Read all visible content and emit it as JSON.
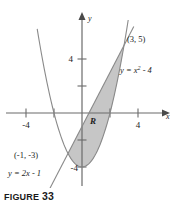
{
  "figure": {
    "caption_word": "FIGURE",
    "caption_number": "33"
  },
  "axes": {
    "x_name": "x",
    "y_name": "y",
    "x_tick_labels": [
      "-4",
      "4"
    ],
    "y_tick_labels": [
      "4",
      "-4"
    ],
    "x_neg4": "-4",
    "x_pos4": "4",
    "y_pos4": "4",
    "y_neg4": "-4"
  },
  "annotations": {
    "region_label": "R",
    "point_upper": "(3, 5)",
    "point_lower": "(-1, -3)",
    "curve_parabola": "y = x",
    "curve_parabola_exp": "2",
    "curve_parabola_tail": " - 4",
    "curve_line": "y = 2x - 1"
  },
  "colors": {
    "shade": "#c6c6c6",
    "axis": "#6b6b6b",
    "curve": "#8a8a8a",
    "text": "#1d1d1d"
  },
  "chart_data": {
    "type": "line",
    "title": "FIGURE 33",
    "xlabel": "x",
    "ylabel": "y",
    "xlim": [
      -5.2,
      6.0
    ],
    "ylim": [
      -5.0,
      6.5
    ],
    "grid": false,
    "legend": "none",
    "series": [
      {
        "name": "y = x^2 - 4",
        "type": "parabola",
        "equation": "y = x^2 - 4",
        "vertex": [
          0,
          -4
        ],
        "x_intercepts": [
          -2,
          2
        ],
        "y_intercept": -4
      },
      {
        "name": "y = 2x - 1",
        "type": "line",
        "equation": "y = 2x - 1",
        "slope": 2,
        "intercept": -1,
        "x_intercept": 0.5
      }
    ],
    "intersections": [
      {
        "label": "(-1, -3)",
        "x": -1,
        "y": -3
      },
      {
        "label": "(3, 5)",
        "x": 3,
        "y": 5
      }
    ],
    "shaded_region": {
      "label": "R",
      "upper_curve": "y = 2x - 1",
      "lower_curve": "y = x^2 - 4",
      "x_range": [
        -1,
        3
      ]
    },
    "x_ticks": [
      -4,
      -2,
      2,
      4
    ],
    "y_ticks": [
      4,
      2,
      -2,
      -4
    ],
    "x_tick_labels_shown": [
      -4,
      4
    ],
    "y_tick_labels_shown": [
      4,
      -4
    ]
  }
}
